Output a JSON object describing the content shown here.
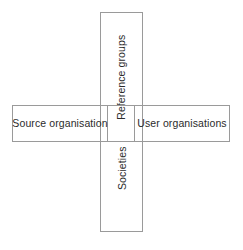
{
  "diagram": {
    "background_color": "#ffffff",
    "border_color": "#9a9a9a",
    "text_color": "#2b2b2b",
    "boxes": [
      {
        "id": "reference-groups",
        "label": "Reference groups",
        "orientation": "vertical",
        "text_rotation": "-90deg",
        "position": "top-center"
      },
      {
        "id": "source-organisation",
        "label": "Source organisation",
        "orientation": "horizontal",
        "text_rotation": "0deg",
        "position": "middle-left"
      },
      {
        "id": "user-organisations",
        "label": "User organisations",
        "orientation": "horizontal",
        "text_rotation": "0deg",
        "position": "middle-right"
      },
      {
        "id": "societies",
        "label": "Societies",
        "orientation": "vertical",
        "text_rotation": "-90deg",
        "position": "bottom-center"
      }
    ],
    "caption": ""
  }
}
